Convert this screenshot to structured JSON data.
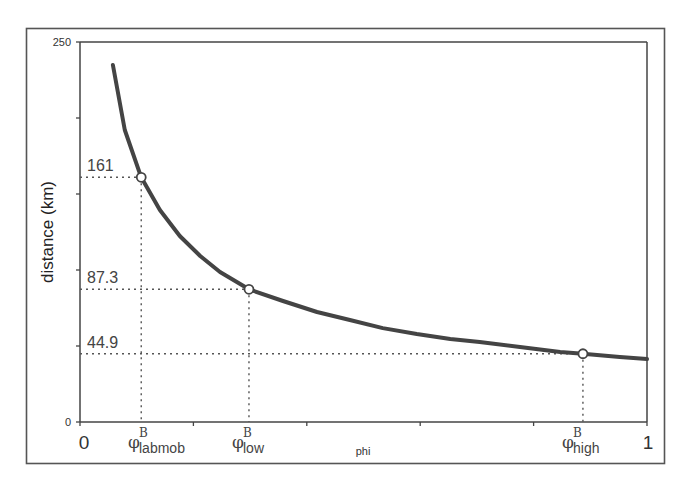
{
  "chart_data": {
    "type": "line",
    "title": "",
    "xlabel": "phi",
    "ylabel": "distance (km)",
    "xlim": [
      0,
      1
    ],
    "ylim": [
      0,
      250
    ],
    "grid": false,
    "legend": null,
    "x_tick_labels": [
      "0",
      "1"
    ],
    "x_ticks": [
      0,
      0.2,
      0.4,
      0.6,
      0.8,
      1.0
    ],
    "y_tick_labels": [
      "0",
      "250"
    ],
    "y_ticks": [
      0,
      50,
      100,
      150,
      200,
      250
    ],
    "series": [
      {
        "name": "distance",
        "x": [
          0.058,
          0.079,
          0.108,
          0.141,
          0.176,
          0.212,
          0.247,
          0.298,
          0.358,
          0.418,
          0.476,
          0.534,
          0.594,
          0.653,
          0.705,
          0.776,
          0.847,
          0.887,
          0.952,
          1.0
        ],
        "y": [
          234.9,
          192.1,
          161.0,
          139.5,
          122.4,
          109.2,
          98.7,
          87.3,
          79.6,
          72.4,
          67.1,
          61.8,
          57.9,
          54.6,
          52.6,
          49.3,
          46.1,
          44.9,
          42.8,
          41.4
        ]
      }
    ],
    "annotations": [
      {
        "label": "labmob",
        "symbol": "φ",
        "superscript": "B",
        "x": 0.108,
        "y": 161,
        "value_label": "161"
      },
      {
        "label": "low",
        "symbol": "φ",
        "superscript": "B",
        "x": 0.298,
        "y": 87.3,
        "value_label": "87.3"
      },
      {
        "label": "high",
        "symbol": "φ",
        "superscript": "B",
        "x": 0.887,
        "y": 44.9,
        "value_label": "44.9"
      }
    ]
  },
  "labels": {
    "ylabel": "distance (km)",
    "xlabel": "phi",
    "y_top": "250",
    "y_bottom": "0",
    "x_left": "0",
    "x_right": "1",
    "phi_symbol": "φ",
    "phi_sup": "B",
    "sub_labmob": "labmob",
    "sub_low": "low",
    "sub_high": "high",
    "val_labmob": "161",
    "val_low": "87.3",
    "val_high": "44.9"
  }
}
